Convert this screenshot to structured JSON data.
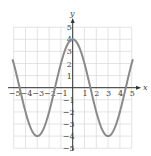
{
  "chart_data": {
    "type": "line",
    "title": "",
    "xlabel": "x",
    "ylabel": "y",
    "xlim": [
      -5,
      5
    ],
    "ylim": [
      -5,
      5
    ],
    "grid": true,
    "x_ticks": [
      "-5",
      "-4",
      "-3",
      "-2",
      "-1",
      "1",
      "2",
      "3",
      "4",
      "5"
    ],
    "y_ticks": [
      "5",
      "4",
      "3",
      "2",
      "1",
      "-1",
      "-2",
      "-3",
      "-4",
      "-5"
    ],
    "series": [
      {
        "name": "y = 4cos(πx/3)",
        "x": [
          -5,
          -4.5,
          -4,
          -3,
          -2,
          -1.5,
          -1,
          0,
          1,
          1.5,
          2,
          3,
          4,
          4.5,
          5
        ],
        "values": [
          1.3,
          0,
          -2,
          -4,
          -2,
          0,
          2,
          4,
          2,
          0,
          -2,
          -4,
          -2,
          0,
          1.3
        ]
      }
    ],
    "colors": {
      "curve": "#8a8a8a",
      "grid": "#d8d8d8",
      "axis": "#333333"
    }
  }
}
